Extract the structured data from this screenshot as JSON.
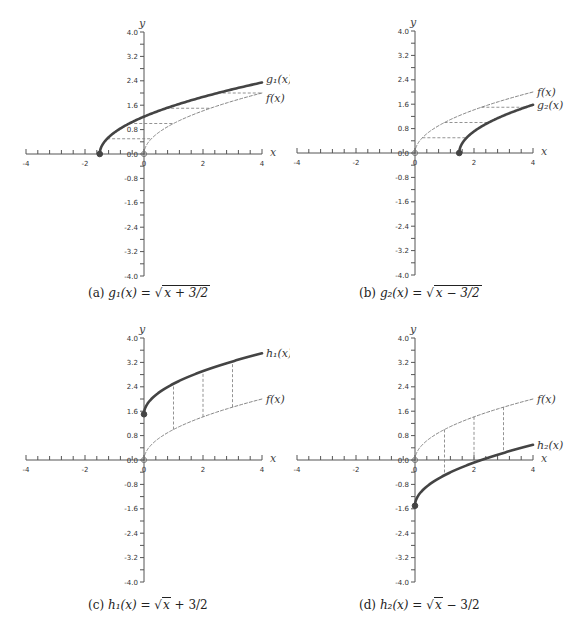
{
  "chart_data": [
    {
      "type": "line",
      "panel": "a",
      "caption": "(a) g₁(x) = √(x + 3/2)",
      "xlabel": "x",
      "ylabel": "y",
      "xlim": [
        -4,
        4
      ],
      "ylim": [
        -4.0,
        4.0
      ],
      "x_ticks": [
        "-4",
        "-2",
        "0",
        "2",
        "4"
      ],
      "y_ticks": [
        "4.0",
        "3.2",
        "2.4",
        "1.6",
        "0.8",
        "0.0",
        "-0.8",
        "-1.6",
        "-2.4",
        "-3.2",
        "-4.0"
      ],
      "series": [
        {
          "name": "g1(x)",
          "label": "g₁(x)",
          "style": "thick solid",
          "formula": "sqrt(x+1.5)",
          "domain": [
            -1.5,
            4
          ],
          "start_point": [
            -1.5,
            0
          ]
        },
        {
          "name": "f(x)",
          "label": "f(x)",
          "style": "dashed",
          "formula": "sqrt(x)",
          "domain": [
            0,
            4
          ],
          "start_point": [
            0,
            0
          ]
        }
      ],
      "guides": {
        "orientation": "horizontal",
        "y_values": [
          0.5,
          1.0,
          1.5,
          2.0
        ]
      }
    },
    {
      "type": "line",
      "panel": "b",
      "caption": "(b) g₂(x) = √(x − 3/2)",
      "xlabel": "x",
      "ylabel": "y",
      "xlim": [
        -4,
        4
      ],
      "ylim": [
        -4.0,
        4.0
      ],
      "x_ticks": [
        "-4",
        "-2",
        "0",
        "2",
        "4"
      ],
      "y_ticks": [
        "4.0",
        "3.2",
        "2.4",
        "1.6",
        "0.8",
        "0.0",
        "-0.8",
        "-1.6",
        "-2.4",
        "-3.2",
        "-4.0"
      ],
      "series": [
        {
          "name": "f(x)",
          "label": "f(x)",
          "style": "dashed",
          "formula": "sqrt(x)",
          "domain": [
            0,
            4
          ],
          "start_point": [
            0,
            0
          ]
        },
        {
          "name": "g2(x)",
          "label": "g₂(x)",
          "style": "thick solid",
          "formula": "sqrt(x-1.5)",
          "domain": [
            1.5,
            4
          ],
          "start_point": [
            1.5,
            0
          ]
        }
      ],
      "guides": {
        "orientation": "horizontal",
        "y_values": [
          0.5,
          1.0,
          1.5
        ]
      }
    },
    {
      "type": "line",
      "panel": "c",
      "caption": "(c) h₁(x) = √x + 3/2",
      "xlabel": "x",
      "ylabel": "y",
      "xlim": [
        -4,
        4
      ],
      "ylim": [
        -4.0,
        4.0
      ],
      "x_ticks": [
        "-4",
        "-2",
        "0",
        "2",
        "4"
      ],
      "y_ticks": [
        "4.0",
        "3.2",
        "2.4",
        "1.6",
        "0.8",
        "0.0",
        "-0.8",
        "-1.6",
        "-2.4",
        "-3.2",
        "-4.0"
      ],
      "series": [
        {
          "name": "h1(x)",
          "label": "h₁(x)",
          "style": "thick solid",
          "formula": "sqrt(x)+1.5",
          "domain": [
            0,
            4
          ],
          "start_point": [
            0,
            1.5
          ]
        },
        {
          "name": "f(x)",
          "label": "f(x)",
          "style": "dashed",
          "formula": "sqrt(x)",
          "domain": [
            0,
            4
          ],
          "start_point": [
            0,
            0
          ]
        }
      ],
      "guides": {
        "orientation": "vertical",
        "x_values": [
          1,
          2,
          3
        ]
      }
    },
    {
      "type": "line",
      "panel": "d",
      "caption": "(d) h₂(x) = √x − 3/2",
      "xlabel": "x",
      "ylabel": "y",
      "xlim": [
        -4,
        4
      ],
      "ylim": [
        -4.0,
        4.0
      ],
      "x_ticks": [
        "-4",
        "-2",
        "0",
        "2",
        "4"
      ],
      "y_ticks": [
        "4.0",
        "3.2",
        "2.4",
        "1.6",
        "0.8",
        "0.0",
        "-0.8",
        "-1.6",
        "-2.4",
        "-3.2",
        "-4.0"
      ],
      "series": [
        {
          "name": "f(x)",
          "label": "f(x)",
          "style": "dashed",
          "formula": "sqrt(x)",
          "domain": [
            0,
            4
          ],
          "start_point": [
            0,
            0
          ]
        },
        {
          "name": "h2(x)",
          "label": "h₂(x)",
          "style": "thick solid",
          "formula": "sqrt(x)-1.5",
          "domain": [
            0,
            4
          ],
          "start_point": [
            0,
            -1.5
          ]
        }
      ],
      "guides": {
        "orientation": "vertical",
        "x_values": [
          1,
          2,
          3
        ]
      }
    }
  ],
  "captions": {
    "a": {
      "tag": "(a)",
      "lhs": "g₁(x)",
      "rhs": "x + 3/2"
    },
    "b": {
      "tag": "(b)",
      "lhs": "g₂(x)",
      "rhs": "x − 3/2"
    },
    "c": {
      "tag": "(c)",
      "lhs": "h₁(x)",
      "rhs": "x",
      "suffix": "+ 3/2"
    },
    "d": {
      "tag": "(d)",
      "lhs": "h₂(x)",
      "rhs": "x",
      "suffix": "− 3/2"
    }
  },
  "colors": {
    "curve": "#444444",
    "dashed": "#777777",
    "axis": "#555555"
  }
}
